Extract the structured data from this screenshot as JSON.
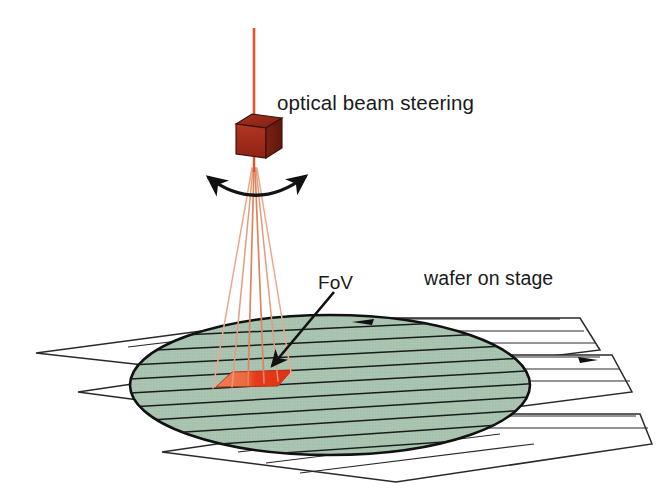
{
  "figure": {
    "background_color": "#ffffff"
  },
  "labels": {
    "optical_beam_steering": "optical beam steering",
    "wafer_on_stage": "wafer on stage",
    "fov": "FoV"
  },
  "components": {
    "beam_steering_cube": {
      "name": "optical beam steering cube",
      "front_face_color": "#a32d1e",
      "top_face_color": "#8e2617",
      "side_face_color": "#6d1c11",
      "outline_color": "#3a0f08"
    },
    "incoming_beam": {
      "name": "incoming laser beam",
      "color": "#e8522a",
      "width_px": 2.5
    },
    "beam_fan": {
      "name": "steered beam fan",
      "color": "#e8a184",
      "ray_count": 6
    },
    "steering_arc_arrow": {
      "name": "double headed steering arrow",
      "color": "#141414"
    },
    "wafer": {
      "name": "wafer disc",
      "fill_color": "#a8c4b0",
      "outline_color": "#111111",
      "scan_line_color": "#1a1a1a"
    },
    "stage": {
      "name": "stage scan sheets",
      "fill_color": "#ffffff",
      "outline_color": "#2a2a2a",
      "sheet_count": 3
    },
    "fov_patch": {
      "name": "field of view patch",
      "left_color": "#e8643c",
      "right_color": "#e8321a",
      "outline_color": "#b02a14"
    },
    "fov_pointer": {
      "name": "FoV leader arrow",
      "color": "#111111"
    },
    "stage_direction_arrows": {
      "name": "stage travel direction arrows",
      "color": "#111111",
      "count": 2
    }
  },
  "colors": {
    "accent_red": "#e8321a",
    "wafer_green": "#a8c4b0",
    "cube_red": "#a32d1e",
    "ink": "#111111"
  }
}
